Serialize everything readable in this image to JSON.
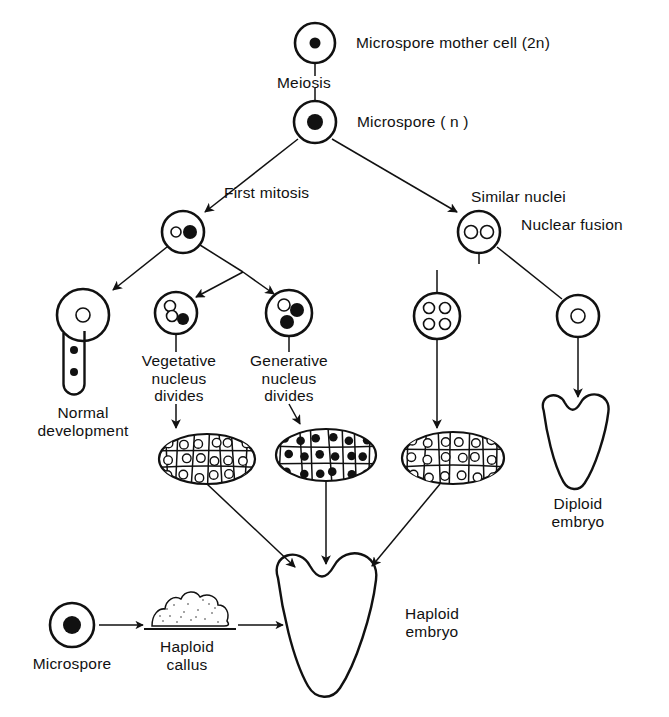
{
  "colors": {
    "ink": "#111111",
    "background": "#ffffff",
    "nucleus_filled": "#111111",
    "nucleus_open": "#ffffff"
  },
  "labels": {
    "microspore_mother_cell": "Microspore mother cell (2n)",
    "meiosis": "Meiosis",
    "microspore_n": "Microspore ( n )",
    "first_mitosis": "First mitosis",
    "similar_nuclei": "Similar nuclei",
    "nuclear_fusion": "Nuclear fusion",
    "vegetative_nucleus_divides": "Vegetative\nnucleus\ndivides",
    "generative_nucleus_divides": "Generative\nnucleus\ndivides",
    "normal_development": "Normal\ndevelopment",
    "diploid_embryo": "Diploid\nembryo",
    "haploid_embryo": "Haploid\nembryo",
    "microspore": "Microspore",
    "haploid_callus": "Haploid\ncallus"
  },
  "cells": [
    {
      "id": "microspore-mother-cell",
      "cx": 315,
      "cy": 43,
      "r": 20,
      "nuclei": [
        {
          "dx": 0,
          "dy": 0,
          "r": 5.5,
          "filled": true
        }
      ]
    },
    {
      "id": "microspore",
      "cx": 315,
      "cy": 122,
      "r": 21,
      "nuclei": [
        {
          "dx": 0,
          "dy": 0,
          "r": 8,
          "filled": true
        }
      ]
    },
    {
      "id": "two-nuclei-cell-unequal",
      "cx": 183,
      "cy": 232,
      "r": 21,
      "nuclei": [
        {
          "dx": -7,
          "dy": 0,
          "r": 5,
          "filled": false
        },
        {
          "dx": 7,
          "dy": 0,
          "r": 7,
          "filled": true
        }
      ]
    },
    {
      "id": "two-nuclei-cell-similar",
      "cx": 479,
      "cy": 232,
      "r": 21,
      "nuclei": [
        {
          "dx": -8,
          "dy": 0,
          "r": 6.5,
          "filled": false
        },
        {
          "dx": 8,
          "dy": 0,
          "r": 6.5,
          "filled": false
        }
      ]
    },
    {
      "id": "pollen-grain-with-tube",
      "cx": 83,
      "cy": 315,
      "r": 26,
      "nuclei": [
        {
          "dx": 0,
          "dy": 0,
          "r": 7,
          "filled": false
        }
      ]
    },
    {
      "id": "vegetative-divided-cell",
      "cx": 176,
      "cy": 313,
      "r": 21,
      "nuclei": [
        {
          "dx": -6,
          "dy": -7,
          "r": 5.5,
          "filled": false
        },
        {
          "dx": -4,
          "dy": 3,
          "r": 5.5,
          "filled": false
        },
        {
          "dx": 7,
          "dy": 6,
          "r": 6,
          "filled": true
        }
      ]
    },
    {
      "id": "generative-divided-cell",
      "cx": 289,
      "cy": 313,
      "r": 23,
      "nuclei": [
        {
          "dx": -5,
          "dy": -8,
          "r": 6,
          "filled": false
        },
        {
          "dx": 8,
          "dy": -3,
          "r": 7,
          "filled": true
        },
        {
          "dx": -2,
          "dy": 9,
          "r": 7,
          "filled": true
        }
      ]
    },
    {
      "id": "four-nuclei-cell",
      "cx": 437,
      "cy": 316,
      "r": 23,
      "nuclei": [
        {
          "dx": -8,
          "dy": -8,
          "r": 5.5,
          "filled": false
        },
        {
          "dx": 8,
          "dy": -8,
          "r": 5.5,
          "filled": false
        },
        {
          "dx": -8,
          "dy": 8,
          "r": 5.5,
          "filled": false
        },
        {
          "dx": 8,
          "dy": 8,
          "r": 5.5,
          "filled": false
        }
      ]
    },
    {
      "id": "fused-nucleus-cell",
      "cx": 578,
      "cy": 316,
      "r": 21,
      "nuclei": [
        {
          "dx": 0,
          "dy": 0,
          "r": 7,
          "filled": false
        }
      ]
    },
    {
      "id": "microspore-bottom",
      "cx": 72,
      "cy": 625,
      "r": 22,
      "nuclei": [
        {
          "dx": 0,
          "dy": 0,
          "r": 9,
          "filled": true
        }
      ]
    }
  ],
  "embryoids": [
    {
      "id": "embryoid-vegetative",
      "cx": 207,
      "cy": 459,
      "rx": 48,
      "ry": 25,
      "nuclei_filled": false
    },
    {
      "id": "embryoid-generative",
      "cx": 326,
      "cy": 455,
      "rx": 50,
      "ry": 26,
      "nuclei_filled": true
    },
    {
      "id": "embryoid-similar",
      "cx": 453,
      "cy": 458,
      "rx": 51,
      "ry": 26,
      "nuclei_filled": false
    }
  ],
  "embryos": [
    {
      "id": "haploid-embryo",
      "cx": 330,
      "cy": 630
    },
    {
      "id": "diploid-embryo",
      "cx": 578,
      "cy": 445
    }
  ],
  "callus": {
    "id": "haploid-callus",
    "cx": 186,
    "cy": 620
  }
}
